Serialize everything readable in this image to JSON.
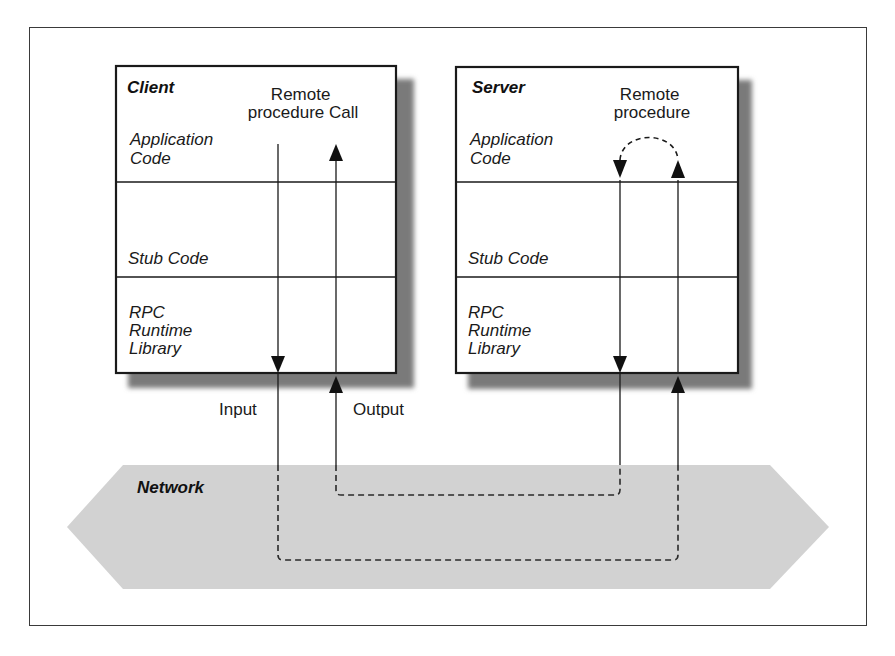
{
  "diagram": {
    "type": "rpc-architecture",
    "client": {
      "title": "Client",
      "layers": [
        {
          "lines": [
            "Application",
            "Code"
          ]
        },
        {
          "lines": [
            "Stub Code"
          ]
        },
        {
          "lines": [
            "RPC",
            "Runtime",
            "Library"
          ]
        }
      ],
      "annotation": [
        "Remote",
        "procedure Call"
      ]
    },
    "server": {
      "title": "Server",
      "layers": [
        {
          "lines": [
            "Application",
            "Code"
          ]
        },
        {
          "lines": [
            "Stub Code"
          ]
        },
        {
          "lines": [
            "RPC",
            "Runtime",
            "Library"
          ]
        }
      ],
      "annotation": [
        "Remote",
        "procedure"
      ]
    },
    "flow_labels": {
      "input": "Input",
      "output": "Output"
    },
    "network": {
      "label": "Network",
      "fill_color": "#d2d2d2"
    },
    "colors": {
      "line": "#1a1a1a",
      "shadow": "#7a7a7a",
      "box_fill": "#ffffff"
    }
  }
}
